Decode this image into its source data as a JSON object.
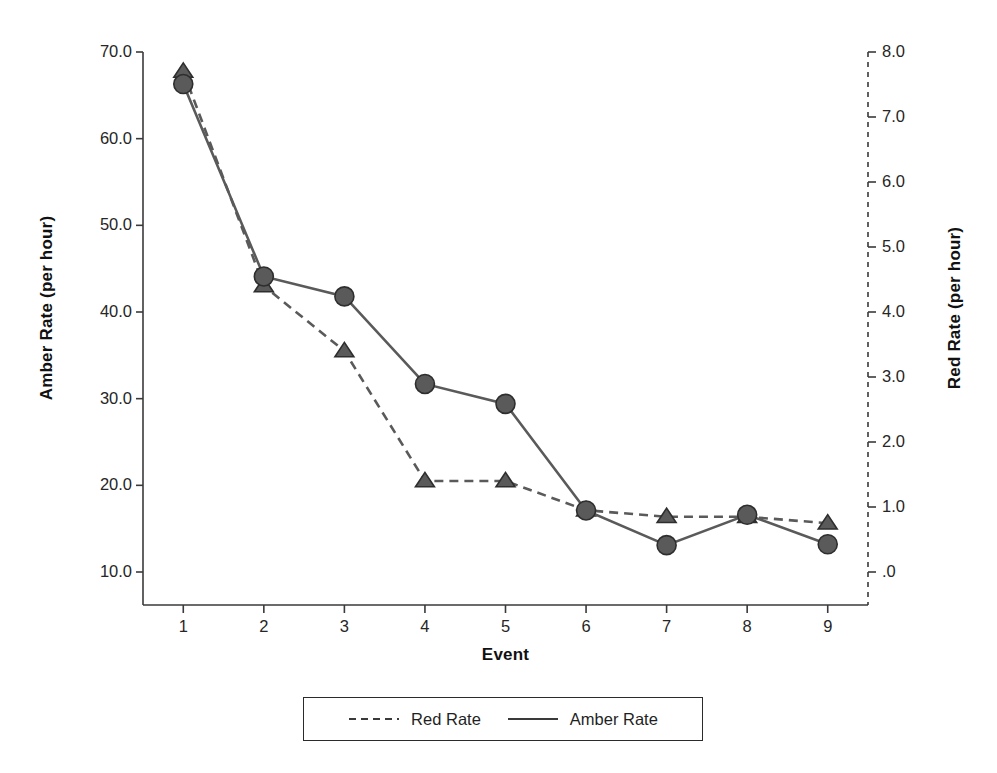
{
  "chart_data": {
    "type": "line",
    "title": "",
    "xlabel": "Event",
    "x": [
      1,
      2,
      3,
      4,
      5,
      6,
      7,
      8,
      9
    ],
    "xtick_labels": [
      "1",
      "2",
      "3",
      "4",
      "5",
      "6",
      "7",
      "8",
      "9"
    ],
    "xlim": [
      0.5,
      9.5
    ],
    "grid": false,
    "legend_position": "below-axes",
    "axes": {
      "left": {
        "label": "Amber Rate (per hour)",
        "ylim": [
          6.0,
          70.0
        ],
        "ticks": [
          10.0,
          20.0,
          30.0,
          40.0,
          50.0,
          60.0,
          70.0
        ],
        "tick_labels": [
          "10.0",
          "20.0",
          "30.0",
          "40.0",
          "50.0",
          "60.0",
          "70.0"
        ],
        "line_style": "solid"
      },
      "right": {
        "label": "Red Rate (per hour)",
        "ylim": [
          -0.5,
          8.0
        ],
        "ticks": [
          0.0,
          1.0,
          2.0,
          3.0,
          4.0,
          5.0,
          6.0,
          7.0,
          8.0
        ],
        "tick_labels": [
          ".0",
          "1.0",
          "2.0",
          "3.0",
          "4.0",
          "5.0",
          "6.0",
          "7.0",
          "8.0"
        ],
        "line_style": "dashed"
      }
    },
    "series": [
      {
        "name": "Red Rate",
        "axis": "right",
        "line_style": "dashed",
        "marker": "triangle",
        "color": "#5a5a5a",
        "values": [
          7.7,
          4.4,
          3.4,
          1.4,
          1.4,
          0.95,
          0.85,
          0.85,
          0.75
        ]
      },
      {
        "name": "Amber Rate",
        "axis": "left",
        "line_style": "solid",
        "marker": "circle",
        "color": "#5a5a5a",
        "values": [
          66.3,
          44.1,
          41.8,
          31.7,
          29.4,
          17.1,
          13.1,
          16.6,
          13.2
        ]
      }
    ]
  },
  "legend": {
    "entries": [
      {
        "label": "Red Rate",
        "style": "dashed"
      },
      {
        "label": "Amber Rate",
        "style": "solid"
      }
    ]
  },
  "colors": {
    "series": "#5a5a5a",
    "axis": "#3a3a3a",
    "text": "#1a1a1a",
    "background": "#ffffff"
  }
}
